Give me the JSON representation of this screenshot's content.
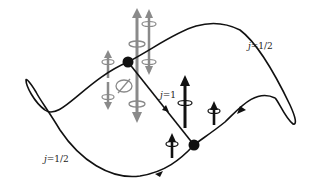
{
  "labels": {
    "top_right": {
      "var": "j",
      "value": "=1/2"
    },
    "bottom_left": {
      "var": "j",
      "value": "=1/2"
    },
    "middle": {
      "var": "j",
      "value": "=1"
    }
  },
  "nodes": [
    {
      "name": "upper-node",
      "x": 128,
      "y": 62
    },
    {
      "name": "lower-node",
      "x": 194,
      "y": 145
    }
  ],
  "colors": {
    "line": "#111111",
    "gray_arrow": "#8a8a8a",
    "black_arrow": "#111111"
  }
}
